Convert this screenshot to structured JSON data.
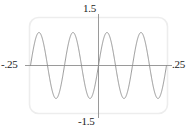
{
  "figure": {
    "width": 191,
    "height": 137,
    "background": "#ffffff"
  },
  "labels": {
    "top": "1.5",
    "bottom": "-1.5",
    "left": "-.25",
    "right": ".25"
  },
  "colors": {
    "curve": "#8a8a8a",
    "axis": "#9a9a9a",
    "frame": "#ededed",
    "text": "#1a1a1a"
  },
  "chart_data": {
    "type": "line",
    "title": "",
    "xlabel": "",
    "ylabel": "",
    "xlim": [
      -0.25,
      0.25
    ],
    "ylim": [
      -1.5,
      1.5
    ],
    "grid": false,
    "legend": null,
    "frame": "rounded-rectangle",
    "xticks": [
      -0.25,
      0.25
    ],
    "xticklabels": [
      "-.25",
      ".25"
    ],
    "yticks": [
      -1.5,
      1.5
    ],
    "yticklabels": [
      "-1.5",
      "1.5"
    ],
    "series": [
      {
        "name": "sin(16 pi x)",
        "expression": "y = sin(16*pi*x)",
        "amplitude": 1.0,
        "cycles": 4,
        "x": [
          -0.25,
          -0.2421875,
          -0.234375,
          -0.2265625,
          -0.21875,
          -0.2109375,
          -0.203125,
          -0.1953125,
          -0.1875,
          -0.1796875,
          -0.171875,
          -0.1640625,
          -0.15625,
          -0.1484375,
          -0.140625,
          -0.1328125,
          -0.125,
          -0.1171875,
          -0.109375,
          -0.1015625,
          -0.09375,
          -0.0859375,
          -0.078125,
          -0.0703125,
          -0.0625,
          -0.0546875,
          -0.046875,
          -0.0390625,
          -0.03125,
          -0.0234375,
          -0.015625,
          -0.0078125,
          0,
          0.0078125,
          0.015625,
          0.0234375,
          0.03125,
          0.0390625,
          0.046875,
          0.0546875,
          0.0625,
          0.0703125,
          0.078125,
          0.0859375,
          0.09375,
          0.1015625,
          0.109375,
          0.1171875,
          0.125,
          0.1328125,
          0.140625,
          0.1484375,
          0.15625,
          0.1640625,
          0.171875,
          0.1796875,
          0.1875,
          0.1953125,
          0.203125,
          0.2109375,
          0.21875,
          0.2265625,
          0.234375,
          0.2421875,
          0.25
        ],
        "y": [
          0,
          0.3827,
          0.7071,
          0.9239,
          1,
          0.9239,
          0.7071,
          0.3827,
          0,
          -0.3827,
          -0.7071,
          -0.9239,
          -1,
          -0.9239,
          -0.7071,
          -0.3827,
          0,
          0.3827,
          0.7071,
          0.9239,
          1,
          0.9239,
          0.7071,
          0.3827,
          0,
          -0.3827,
          -0.7071,
          -0.9239,
          -1,
          -0.9239,
          -0.7071,
          -0.3827,
          0,
          0.3827,
          0.7071,
          0.9239,
          1,
          0.9239,
          0.7071,
          0.3827,
          0,
          -0.3827,
          -0.7071,
          -0.9239,
          -1,
          -0.9239,
          -0.7071,
          -0.3827,
          0,
          0.3827,
          0.7071,
          0.9239,
          1,
          0.9239,
          0.7071,
          0.3827,
          0,
          -0.3827,
          -0.7071,
          -0.9239,
          -1,
          -0.9239,
          -0.7071,
          -0.3827,
          0
        ]
      }
    ]
  }
}
